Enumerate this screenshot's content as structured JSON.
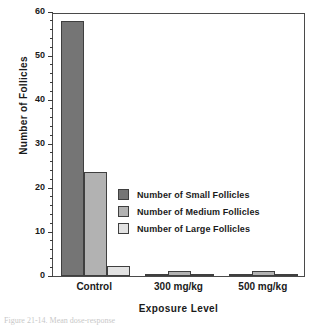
{
  "chart_data": {
    "type": "bar",
    "title": "",
    "xlabel": "Exposure Level",
    "ylabel": "Number of Follicles",
    "categories": [
      "Control",
      "300 mg/kg",
      "500 mg/kg"
    ],
    "series": [
      {
        "name": "Number of Small Follicles",
        "color": "#757575",
        "values": [
          58,
          0.3,
          0.4
        ]
      },
      {
        "name": "Number of Medium Follicles",
        "color": "#b2b2b2",
        "values": [
          23.7,
          1.1,
          1.1
        ]
      },
      {
        "name": "Number of Large Follicles",
        "color": "#e2e2e2",
        "values": [
          2.2,
          0.3,
          0.3
        ]
      }
    ],
    "ylim": [
      0,
      60
    ],
    "yticks": [
      0,
      10,
      20,
      30,
      40,
      50,
      60
    ],
    "ytick_labels": [
      "0",
      "10",
      "20",
      "30",
      "40",
      "50",
      "60"
    ],
    "y_minor_step": 2,
    "grid": false,
    "legend_position": "center-right",
    "frame_color": "#4a4a4a"
  },
  "axes": {
    "y_label": "Number of Follicles",
    "x_label": "Exposure Level"
  },
  "legend": {
    "entries": [
      {
        "label": "Number of Small Follicles",
        "color": "#757575"
      },
      {
        "label": "Number of Medium Follicles",
        "color": "#b2b2b2"
      },
      {
        "label": "Number of Large Follicles",
        "color": "#e2e2e2"
      }
    ]
  },
  "caption": "Figure 21-14.  Mean dose-response"
}
